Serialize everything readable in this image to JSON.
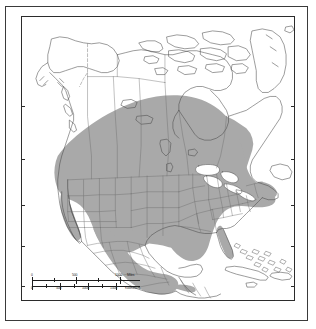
{
  "map": {
    "title": "North America species distribution range map",
    "projection_note": "Lambert-style conic, North America",
    "colors": {
      "range_fill": "#a9a9a9",
      "range_fill_alt": "#b2b2b2",
      "coastline": "#4a4a4a",
      "internal_boundary": "#6b6b6b",
      "neatline": "#2b2b2b",
      "outer_frame": "#3a3a3a",
      "water": "#ffffff",
      "land": "#ffffff"
    },
    "legend": {
      "range_description": "Shaded gray area indicates the distribution range"
    },
    "latitude_ticks_left": [
      {
        "label": "50",
        "y_pct": 31.5
      },
      {
        "label": "40",
        "y_pct": 50.0
      },
      {
        "label": "30",
        "y_pct": 66.5
      },
      {
        "label": "20",
        "y_pct": 81.0
      },
      {
        "label": "10",
        "y_pct": 95.0
      }
    ],
    "latitude_ticks_right": [
      {
        "label": "50",
        "y_pct": 31.5
      },
      {
        "label": "40",
        "y_pct": 50.0
      },
      {
        "label": "30",
        "y_pct": 66.5
      },
      {
        "label": "20",
        "y_pct": 81.0
      },
      {
        "label": "10",
        "y_pct": 95.0
      }
    ],
    "scalebar": {
      "miles": {
        "unit_label": "Miles",
        "ticks": [
          "0",
          "500",
          "1000"
        ]
      },
      "kilometers": {
        "unit_label": "Kilometers",
        "ticks": [
          "0",
          "500",
          "1000",
          "1500"
        ]
      }
    },
    "regions_shaded": [
      "Contiguous United States",
      "Mexico",
      "Southern Canada",
      "Baja California",
      "Florida"
    ],
    "regions_unshaded": [
      "Alaska",
      "Northern Canada",
      "Canadian Arctic Archipelago",
      "Greenland",
      "Great Lakes",
      "Hudson Bay",
      "Cuba",
      "Bahamas",
      "Hispaniola",
      "Central America"
    ]
  }
}
